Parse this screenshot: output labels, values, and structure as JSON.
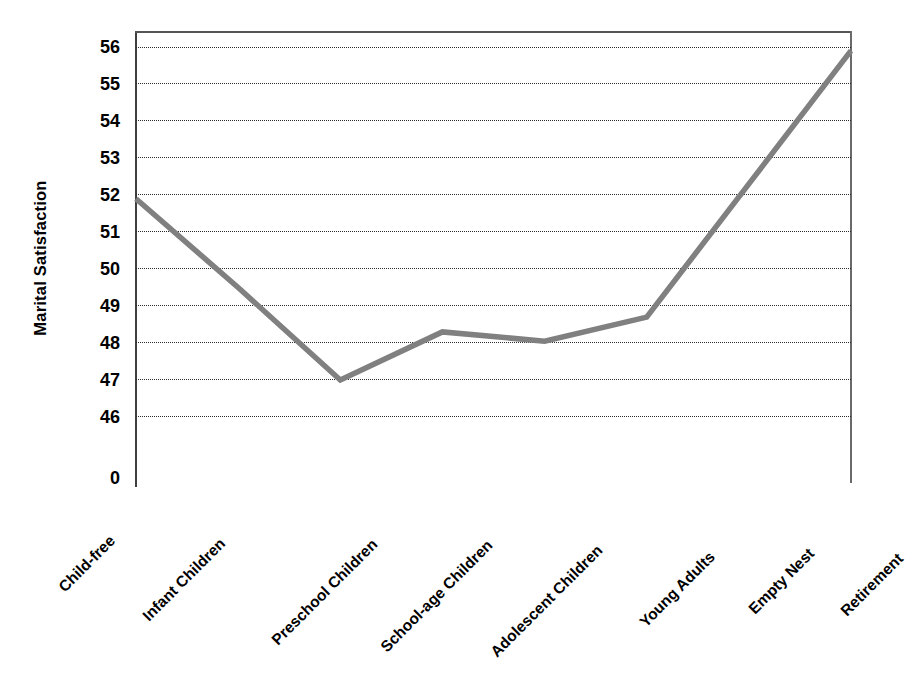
{
  "chart_data": {
    "type": "line",
    "title": "",
    "xlabel": "",
    "ylabel": "Marital Satisfaction",
    "categories": [
      "Child-free",
      "Infant Children",
      "Preschool Children",
      "School-age Children",
      "Adolescent Children",
      "Young Adults",
      "Empty Nest",
      "Retirement"
    ],
    "values": [
      51.9,
      49.5,
      47.0,
      48.3,
      48.05,
      48.7,
      52.3,
      55.9
    ],
    "yticks": [
      "56",
      "55",
      "54",
      "53",
      "52",
      "51",
      "50",
      "49",
      "48",
      "47",
      "46"
    ],
    "ytick_values": [
      56,
      55,
      54,
      53,
      52,
      51,
      50,
      49,
      48,
      47,
      46
    ],
    "zero_tick": "0",
    "ylim": [
      45.6,
      56.4
    ],
    "grid": "horizontal-dotted",
    "legend": "none",
    "series_color": "#808080",
    "axis_color": "#3f3f3f",
    "grid_color": "#2a2a2a"
  },
  "axis": {
    "y_title": "Marital Satisfaction"
  }
}
